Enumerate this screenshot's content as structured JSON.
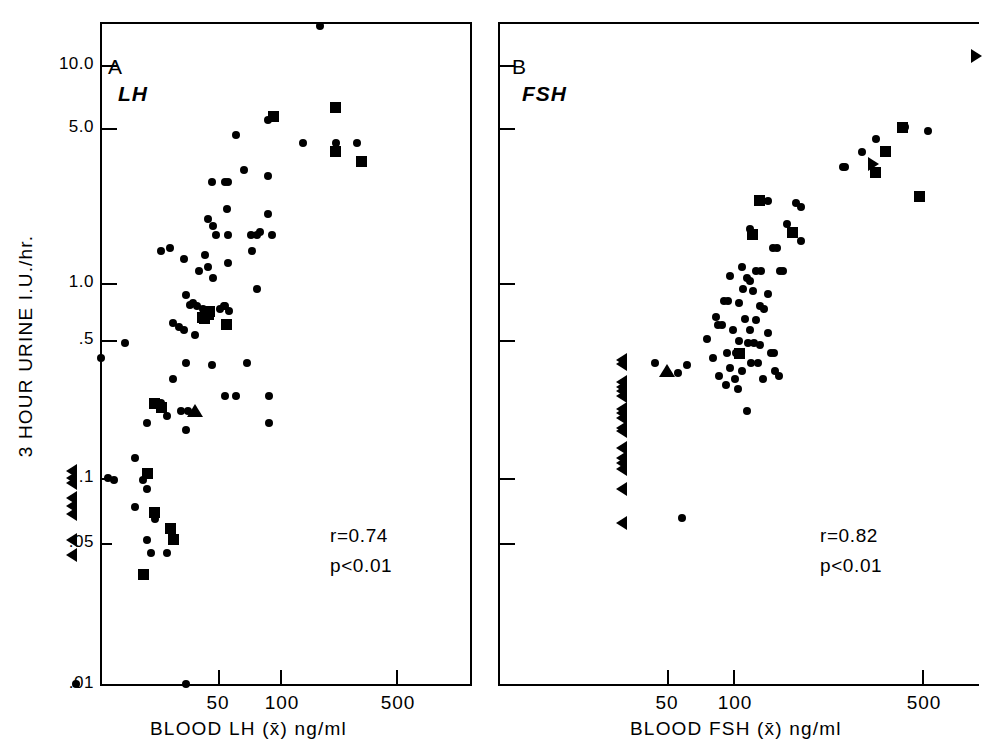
{
  "figure": {
    "y_axis_title": "3 HOUR URINE  I.U./hr.",
    "y_tick_labels": [
      "10.0",
      "5.0",
      "1.0",
      ".5",
      ".1",
      ".05",
      ".01"
    ],
    "x_tick_labels": [
      "50",
      "100",
      "500"
    ]
  },
  "panels": [
    {
      "letter": "A",
      "hormone": "LH",
      "x_axis_title": "BLOOD LH (x̄) ng/ml",
      "stat_r": "r=0.74",
      "stat_p": "p<0.01"
    },
    {
      "letter": "B",
      "hormone": "FSH",
      "x_axis_title": "BLOOD FSH (x̄) ng/ml",
      "stat_r": "r=0.82",
      "stat_p": "p<0.01"
    }
  ],
  "chart_data": [
    {
      "type": "scatter",
      "panel": "A",
      "title": "A  LH",
      "xlabel": "BLOOD LH (x̄) ng/ml",
      "ylabel": "3 HOUR URINE  I.U./hr.",
      "xscale": "log",
      "yscale": "log",
      "xlim": [
        5,
        1200
      ],
      "ylim": [
        0.01,
        20
      ],
      "xticks": [
        50,
        100,
        500
      ],
      "yticks": [
        0.01,
        0.05,
        0.1,
        0.5,
        1.0,
        5.0,
        10.0
      ],
      "grid": false,
      "legend": false,
      "annotations": [
        "r=0.74",
        "p<0.01"
      ],
      "series": [
        {
          "name": "circle",
          "marker": "circle",
          "points": [
            [
              187,
              15.5
            ],
            [
              95,
              5.4
            ],
            [
              63,
              4.6
            ],
            [
              150,
              4.2
            ],
            [
              230,
              4.2
            ],
            [
              300,
              4.2
            ],
            [
              70,
              3.1
            ],
            [
              95,
              2.9
            ],
            [
              46,
              2.7
            ],
            [
              57,
              2.7
            ],
            [
              55,
              2.7
            ],
            [
              56,
              2.0
            ],
            [
              95,
              1.9
            ],
            [
              44,
              1.8
            ],
            [
              47,
              1.65
            ],
            [
              49,
              1.5
            ],
            [
              57,
              1.5
            ],
            [
              77,
              1.5
            ],
            [
              83,
              1.5
            ],
            [
              86,
              1.55
            ],
            [
              101,
              1.5
            ],
            [
              24,
              1.25
            ],
            [
              27,
              1.3
            ],
            [
              42,
              1.2
            ],
            [
              78,
              1.25
            ],
            [
              32,
              1.15
            ],
            [
              44,
              1.05
            ],
            [
              57,
              1.1
            ],
            [
              39,
              1.0
            ],
            [
              47,
              0.93
            ],
            [
              83,
              0.82
            ],
            [
              33,
              0.77
            ],
            [
              35,
              0.69
            ],
            [
              36,
              0.7
            ],
            [
              38,
              0.68
            ],
            [
              41,
              0.66
            ],
            [
              44,
              0.65
            ],
            [
              51,
              0.66
            ],
            [
              54,
              0.68
            ],
            [
              55,
              0.68
            ],
            [
              58,
              0.64
            ],
            [
              28,
              0.56
            ],
            [
              30,
              0.54
            ],
            [
              32,
              0.52
            ],
            [
              37,
              0.49
            ],
            [
              15,
              0.45
            ],
            [
              11,
              0.38
            ],
            [
              33,
              0.36
            ],
            [
              46,
              0.35
            ],
            [
              73,
              0.36
            ],
            [
              28,
              0.3
            ],
            [
              55,
              0.25
            ],
            [
              63,
              0.25
            ],
            [
              97,
              0.25
            ],
            [
              24,
              0.23
            ],
            [
              31,
              0.21
            ],
            [
              34,
              0.21
            ],
            [
              97,
              0.185
            ],
            [
              26,
              0.2
            ],
            [
              33,
              0.17
            ],
            [
              20,
              0.185
            ],
            [
              17,
              0.125
            ],
            [
              19,
              0.097
            ],
            [
              20,
              0.088
            ],
            [
              17,
              0.072
            ],
            [
              22,
              0.063
            ],
            [
              20,
              0.05
            ],
            [
              21,
              0.043
            ],
            [
              26,
              0.043
            ],
            [
              8,
              0.01
            ],
            [
              33,
              0.01
            ],
            [
              12,
              0.1
            ],
            [
              13,
              0.097
            ]
          ]
        },
        {
          "name": "square",
          "marker": "square",
          "points": [
            [
              102,
              5.6
            ],
            [
              230,
              6.2
            ],
            [
              228,
              3.8
            ],
            [
              320,
              3.4
            ],
            [
              45,
              0.64
            ],
            [
              44,
              0.62
            ],
            [
              42,
              0.59
            ],
            [
              41,
              0.6
            ],
            [
              56,
              0.55
            ],
            [
              20,
              0.105
            ],
            [
              22,
              0.23
            ],
            [
              24,
              0.22
            ],
            [
              22,
              0.068
            ],
            [
              27,
              0.057
            ],
            [
              28,
              0.05
            ],
            [
              19,
              0.034
            ]
          ]
        },
        {
          "name": "triangle-left",
          "marker": "tri-left",
          "points": [
            [
              7.5,
              0.108
            ],
            [
              7.5,
              0.1
            ],
            [
              7.5,
              0.094
            ],
            [
              7.5,
              0.08
            ],
            [
              7.5,
              0.073
            ],
            [
              7.5,
              0.067
            ],
            [
              7.5,
              0.05
            ],
            [
              7.5,
              0.042
            ]
          ]
        },
        {
          "name": "triangle-up",
          "marker": "tri-up",
          "points": [
            [
              37,
              0.21
            ]
          ]
        }
      ]
    },
    {
      "type": "scatter",
      "panel": "B",
      "title": "B  FSH",
      "xlabel": "BLOOD FSH (x̄) ng/ml",
      "ylabel": "3 HOUR URINE  I.U./hr.",
      "xscale": "log",
      "yscale": "log",
      "xlim": [
        20,
        1200
      ],
      "ylim": [
        0.01,
        20
      ],
      "xticks": [
        50,
        100,
        500
      ],
      "yticks": [
        0.01,
        0.05,
        0.1,
        0.5,
        1.0,
        5.0,
        10.0
      ],
      "grid": false,
      "legend": false,
      "annotations": [
        "r=0.82",
        "p<0.01"
      ],
      "series": [
        {
          "name": "circle",
          "marker": "circle",
          "points": [
            [
              330,
              4.4
            ],
            [
              430,
              5.0
            ],
            [
              530,
              4.8
            ],
            [
              290,
              3.8
            ],
            [
              250,
              3.2
            ],
            [
              245,
              3.2
            ],
            [
              115,
              2.2
            ],
            [
              125,
              2.2
            ],
            [
              160,
              2.15
            ],
            [
              168,
              2.05
            ],
            [
              106,
              1.6
            ],
            [
              148,
              1.7
            ],
            [
              168,
              1.4
            ],
            [
              130,
              1.3
            ],
            [
              135,
              1.3
            ],
            [
              98,
              1.05
            ],
            [
              112,
              1.0
            ],
            [
              117,
              1.0
            ],
            [
              139,
              1.0
            ],
            [
              143,
              1.0
            ],
            [
              88,
              0.95
            ],
            [
              103,
              0.93
            ],
            [
              106,
              0.9
            ],
            [
              99,
              0.82
            ],
            [
              109,
              0.8
            ],
            [
              124,
              0.78
            ],
            [
              84,
              0.72
            ],
            [
              87,
              0.72
            ],
            [
              96,
              0.7
            ],
            [
              116,
              0.68
            ],
            [
              120,
              0.66
            ],
            [
              78,
              0.6
            ],
            [
              101,
              0.59
            ],
            [
              112,
              0.58
            ],
            [
              79,
              0.55
            ],
            [
              82,
              0.55
            ],
            [
              91,
              0.52
            ],
            [
              106,
              0.52
            ],
            [
              124,
              0.5
            ],
            [
              72,
              0.47
            ],
            [
              96,
              0.46
            ],
            [
              104,
              0.45
            ],
            [
              110,
              0.45
            ],
            [
              116,
              0.44
            ],
            [
              86,
              0.4
            ],
            [
              93,
              0.4
            ],
            [
              128,
              0.4
            ],
            [
              131,
              0.4
            ],
            [
              76,
              0.38
            ],
            [
              107,
              0.36
            ],
            [
              114,
              0.36
            ],
            [
              60,
              0.35
            ],
            [
              88,
              0.34
            ],
            [
              98,
              0.33
            ],
            [
              133,
              0.33
            ],
            [
              80,
              0.31
            ],
            [
              92,
              0.3
            ],
            [
              119,
              0.3
            ],
            [
              137,
              0.31
            ],
            [
              85,
              0.28
            ],
            [
              95,
              0.27
            ],
            [
              45,
              0.36
            ],
            [
              55,
              0.32
            ],
            [
              103,
              0.21
            ],
            [
              57,
              0.064
            ]
          ]
        },
        {
          "name": "square",
          "marker": "square",
          "points": [
            [
              420,
              5.0
            ],
            [
              358,
              3.8
            ],
            [
              330,
              3.0
            ],
            [
              490,
              2.3
            ],
            [
              115,
              2.2
            ],
            [
              155,
              1.55
            ],
            [
              108,
              1.5
            ],
            [
              96,
              0.4
            ]
          ]
        },
        {
          "name": "triangle-right",
          "marker": "tri-right",
          "points": [
            [
              820,
              11.0
            ],
            [
              325,
              3.3
            ]
          ]
        },
        {
          "name": "triangle-left",
          "marker": "tri-left",
          "points": [
            [
              33,
              0.37
            ],
            [
              33,
              0.355
            ],
            [
              33,
              0.29
            ],
            [
              33,
              0.275
            ],
            [
              33,
              0.262
            ],
            [
              33,
              0.25
            ],
            [
              33,
              0.215
            ],
            [
              33,
              0.205
            ],
            [
              33,
              0.195
            ],
            [
              33,
              0.175
            ],
            [
              33,
              0.168
            ],
            [
              33,
              0.14
            ],
            [
              33,
              0.125
            ],
            [
              33,
              0.118
            ],
            [
              33,
              0.11
            ],
            [
              33,
              0.088
            ],
            [
              33,
              0.06
            ]
          ]
        },
        {
          "name": "triangle-up",
          "marker": "tri-up",
          "points": [
            [
              50,
              0.33
            ]
          ]
        }
      ]
    }
  ]
}
